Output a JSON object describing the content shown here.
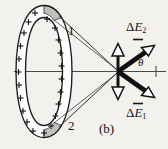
{
  "figure": {
    "caption": "(b)",
    "colors": {
      "background": "#f3f1ed",
      "ink": "#1a1a1a",
      "ring_fill": "#ffffff",
      "segment_fill": "#bfbdb8",
      "thin_line": "#3a3a3a"
    },
    "ring": {
      "charge_symbol": "+",
      "charge_count": 22,
      "segment_labels": [
        {
          "id": "segment-1",
          "text": "1"
        },
        {
          "id": "segment-2",
          "text": "2"
        }
      ]
    },
    "vectors": [
      {
        "id": "delta-e-2",
        "delta": "Δ",
        "symbol": "E",
        "subscript": "2",
        "direction": "up-right",
        "style": "thick-filled"
      },
      {
        "id": "delta-e-1",
        "delta": "Δ",
        "symbol": "E",
        "subscript": "1",
        "direction": "down-right",
        "style": "thick-filled"
      },
      {
        "id": "component-up",
        "direction": "up",
        "style": "thin-hollow"
      },
      {
        "id": "component-down",
        "direction": "down",
        "style": "thin-hollow"
      }
    ],
    "angle": {
      "id": "theta",
      "text": "θ"
    },
    "axis": {
      "id": "axis-line",
      "orientation": "horizontal"
    }
  }
}
